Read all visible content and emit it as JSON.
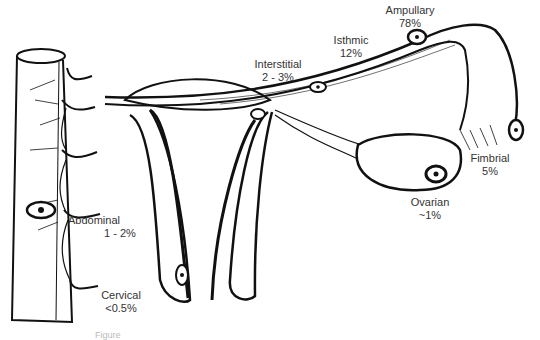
{
  "diagram": {
    "labels": [
      {
        "id": "ampullary",
        "name": "Ampullary",
        "value": "78%"
      },
      {
        "id": "isthmic",
        "name": "Isthmic",
        "value": "12%"
      },
      {
        "id": "interstitial",
        "name": "Interstitial",
        "value": "2 - 3%"
      },
      {
        "id": "fimbrial",
        "name": "Fimbrial",
        "value": "5%"
      },
      {
        "id": "ovarian",
        "name": "Ovarian",
        "value": "~1%"
      },
      {
        "id": "abdominal",
        "name": "Abdominal",
        "value": "1 - 2%"
      },
      {
        "id": "cervical",
        "name": "Cervical",
        "value": "<0.5%"
      }
    ],
    "caption": "Figure"
  }
}
